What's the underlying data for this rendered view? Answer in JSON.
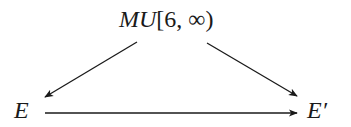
{
  "diagram": {
    "type": "commutative-diagram",
    "nodes": {
      "top": {
        "italic_part": "MU",
        "roman_part": "[6, ∞)"
      },
      "left": {
        "label": "E"
      },
      "right": {
        "label": "E′"
      }
    },
    "edges": [
      {
        "from": "top",
        "to": "left",
        "x1": 137,
        "y1": 42,
        "x2": 45,
        "y2": 97
      },
      {
        "from": "top",
        "to": "right",
        "x1": 207,
        "y1": 43,
        "x2": 297,
        "y2": 96
      },
      {
        "from": "left",
        "to": "right",
        "x1": 45,
        "y1": 113,
        "x2": 297,
        "y2": 113
      }
    ],
    "colors": {
      "stroke": "#1a1a1a",
      "text": "#1a1a1a",
      "background": "#ffffff"
    }
  }
}
